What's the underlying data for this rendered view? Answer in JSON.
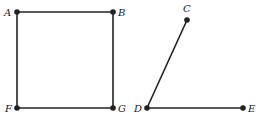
{
  "figure": {
    "square": {
      "points": [
        {
          "label": "A",
          "x": 17,
          "y": 12
        },
        {
          "label": "B",
          "x": 113,
          "y": 12
        },
        {
          "label": "G",
          "x": 113,
          "y": 108
        },
        {
          "label": "F",
          "x": 17,
          "y": 108
        }
      ]
    },
    "angle": {
      "points": [
        {
          "label": "C",
          "x": 187,
          "y": 20
        },
        {
          "label": "D",
          "x": 147,
          "y": 108
        },
        {
          "label": "E",
          "x": 243,
          "y": 108
        }
      ]
    },
    "stroke_color": "#222222"
  }
}
